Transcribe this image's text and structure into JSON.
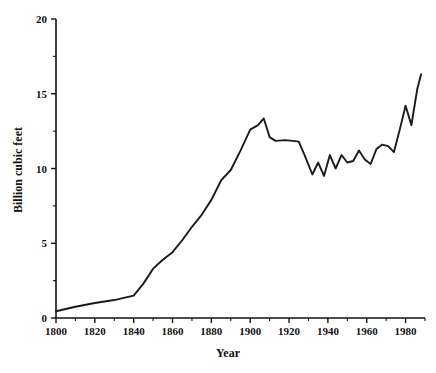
{
  "chart_data": {
    "type": "line",
    "title": "",
    "xlabel": "Year",
    "ylabel": "Billion cubic feet",
    "xlim": [
      1800,
      1990
    ],
    "ylim": [
      0,
      20
    ],
    "grid": false,
    "legend": null,
    "x_ticks_major": [
      1800,
      1820,
      1840,
      1860,
      1880,
      1900,
      1920,
      1940,
      1960,
      1980
    ],
    "x_ticks_minor": [
      1810,
      1830,
      1850,
      1870,
      1890,
      1910,
      1930,
      1950,
      1970,
      1990
    ],
    "x_tick_labels": [
      "1800",
      "1820",
      "1840",
      "1860",
      "1880",
      "1900",
      "1920",
      "1940",
      "1960",
      "1980"
    ],
    "y_ticks_major": [
      0,
      5,
      10,
      15,
      20
    ],
    "y_ticks_minor": [
      2.5,
      7.5,
      12.5,
      17.5
    ],
    "y_tick_labels": [
      "0",
      "5",
      "10",
      "15",
      "20"
    ],
    "line_color": "#1a1a1a",
    "series": [
      {
        "name": "Production",
        "x": [
          1800,
          1810,
          1820,
          1830,
          1840,
          1845,
          1850,
          1855,
          1860,
          1865,
          1870,
          1875,
          1880,
          1885,
          1890,
          1895,
          1900,
          1904,
          1907,
          1910,
          1913,
          1918,
          1922,
          1925,
          1928,
          1932,
          1935,
          1938,
          1941,
          1944,
          1947,
          1950,
          1953,
          1956,
          1959,
          1962,
          1965,
          1968,
          1971,
          1974,
          1977,
          1980,
          1983,
          1986,
          1988
        ],
        "values": [
          0.45,
          0.75,
          1.0,
          1.2,
          1.5,
          2.3,
          3.3,
          3.9,
          4.4,
          5.2,
          6.1,
          6.9,
          7.9,
          9.2,
          9.9,
          11.2,
          12.6,
          12.9,
          13.35,
          12.1,
          11.85,
          11.9,
          11.85,
          11.8,
          10.9,
          9.6,
          10.4,
          9.5,
          10.9,
          10.0,
          10.9,
          10.4,
          10.5,
          11.2,
          10.6,
          10.3,
          11.3,
          11.6,
          11.5,
          11.1,
          12.6,
          14.2,
          12.9,
          15.3,
          16.3
        ]
      }
    ]
  },
  "axis": {
    "y_title": "Billion cubic feet",
    "x_title": "Year"
  }
}
